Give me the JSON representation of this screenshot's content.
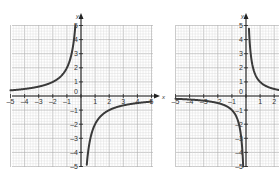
{
  "colors": {
    "background": "#ffffff",
    "grid_minor": "#d9d9d9",
    "grid_major": "#b5b5b5",
    "axis": "#222222",
    "curve": "#3a3a3a",
    "label": "#333333"
  },
  "chart_data": [
    {
      "type": "line",
      "title": "",
      "function": "y = -2/x",
      "xlabel": "x",
      "ylabel": "y",
      "xlim": [
        -5,
        5
      ],
      "ylim": [
        -5,
        5
      ],
      "grid": true,
      "x_ticks": [
        "-5",
        "-4",
        "-3",
        "-2",
        "-1",
        "0",
        "1",
        "2",
        "3",
        "4",
        "5"
      ],
      "y_ticks": [
        "-5",
        "-4",
        "-3",
        "-2",
        "-1",
        "1",
        "2",
        "3",
        "4",
        "5"
      ],
      "series": [
        {
          "name": "left branch",
          "x": [
            -5,
            -4,
            -3,
            -2,
            -1,
            -0.5,
            -0.4
          ],
          "y": [
            0.4,
            0.5,
            0.67,
            1,
            2,
            4,
            5
          ]
        },
        {
          "name": "right branch",
          "x": [
            0.4,
            0.5,
            1,
            2,
            3,
            4,
            5
          ],
          "y": [
            -5,
            -4,
            -2,
            -1,
            -0.67,
            -0.5,
            -0.4
          ]
        }
      ],
      "layout": {
        "origin_px": [
          81,
          96
        ],
        "unit_px": 14.1,
        "grid_px": [
          12,
          25,
          153,
          167
        ]
      }
    },
    {
      "type": "line",
      "title": "",
      "function": "y = 1/x",
      "xlabel": "x",
      "ylabel": "y",
      "xlim": [
        -5,
        5
      ],
      "ylim": [
        -5,
        5
      ],
      "grid": true,
      "x_ticks": [
        "-5",
        "-4",
        "-3",
        "-2",
        "-1",
        "0",
        "1",
        "2"
      ],
      "y_ticks": [
        "-5",
        "-4",
        "-3",
        "-2",
        "-1",
        "1",
        "2",
        "3",
        "4",
        "5"
      ],
      "series": [
        {
          "name": "left branch",
          "x": [
            -5,
            -4,
            -3,
            -2,
            -1,
            -0.5,
            -0.2
          ],
          "y": [
            -0.2,
            -0.25,
            -0.33,
            -0.5,
            -1,
            -2,
            -5
          ]
        },
        {
          "name": "right branch",
          "x": [
            0.2,
            0.5,
            1,
            2,
            3,
            4,
            5
          ],
          "y": [
            5,
            2,
            1,
            0.5,
            0.33,
            0.25,
            0.2
          ]
        }
      ],
      "layout": {
        "origin_px": [
          246,
          96
        ],
        "unit_px": 14.1,
        "grid_px": [
          176,
          25,
          317,
          167
        ]
      }
    }
  ]
}
